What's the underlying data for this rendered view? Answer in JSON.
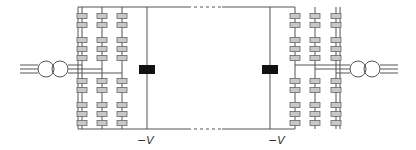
{
  "diagram": {
    "title": "",
    "colors": {
      "line": "#555555",
      "submodule_fill": "#c8c8c8",
      "submodule_stroke": "#666666",
      "reactor": "#111111",
      "background": "#ffffff"
    },
    "left_station": {
      "legs": 3,
      "submodules_per_leg": 10,
      "dc_label": "−V"
    },
    "right_station": {
      "legs": 3,
      "submodules_per_leg": 10,
      "dc_label": "−V"
    },
    "ac_phases": 3,
    "transformers": 2,
    "dc_link": "dashed-continuation"
  }
}
